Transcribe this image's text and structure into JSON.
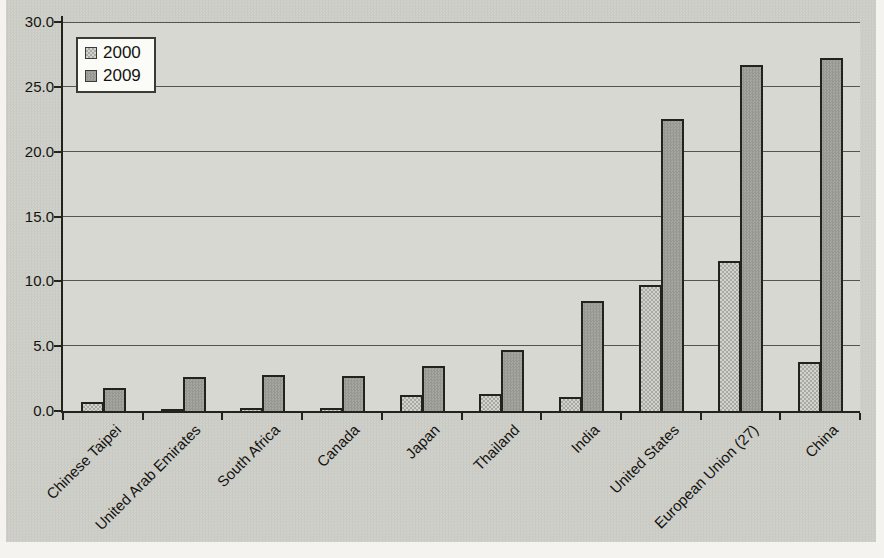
{
  "chart_data": {
    "type": "bar",
    "title": "",
    "xlabel": "",
    "ylabel": "",
    "categories": [
      "Chinese Taipei",
      "United Arab Emirates",
      "South Africa",
      "Canada",
      "Japan",
      "Thailand",
      "India",
      "United States",
      "European Union (27)",
      "China"
    ],
    "series": [
      {
        "name": "2000",
        "values": [
          0.7,
          0.1,
          0.2,
          0.2,
          1.2,
          1.3,
          1.1,
          9.7,
          11.6,
          3.8
        ]
      },
      {
        "name": "2009",
        "values": [
          1.8,
          2.6,
          2.8,
          2.7,
          3.5,
          4.7,
          8.5,
          22.5,
          26.7,
          27.2
        ]
      }
    ],
    "ylim": [
      0,
      30
    ],
    "y_tick_step": 5,
    "y_tick_labels": [
      "0.0",
      "5.0",
      "10.0",
      "15.0",
      "20.0",
      "25.0",
      "30.0"
    ],
    "grid": "horizontal",
    "legend_position": "top-left",
    "legend_entries": [
      "2000",
      "2009"
    ]
  },
  "colors": {
    "series_2000_fill": "#d3d3cd",
    "series_2000_pattern": "#a9a9a3",
    "series_2009_fill": "#a6a6a0",
    "gridline": "#56544e",
    "axis": "#23221e",
    "plot_background": "#d8d8d2",
    "page_background": "#d1d1cc",
    "legend_background": "#fbfbf7",
    "text": "#14130f"
  }
}
